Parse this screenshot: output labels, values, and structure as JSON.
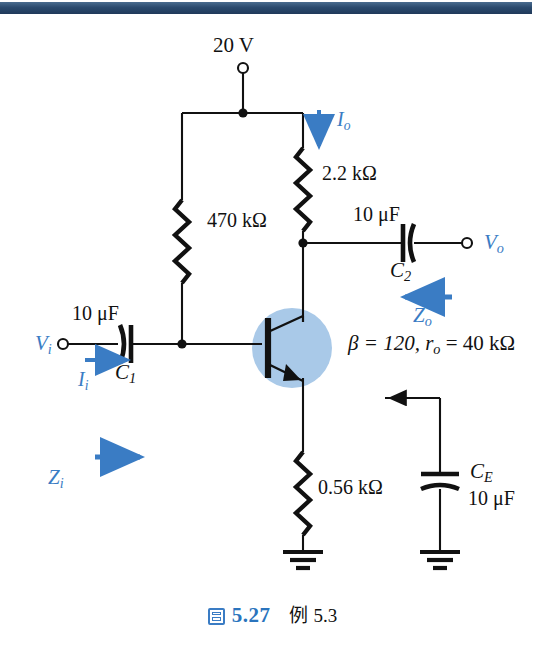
{
  "page": {
    "topbar_color": "#2e4f73",
    "background": "#ffffff",
    "accent_blue": "#3a7cc4"
  },
  "circuit": {
    "type": "bjt-common-emitter-amplifier-schematic",
    "supply": {
      "label": "20 V",
      "terminal": "open-circle"
    },
    "resistors": [
      {
        "name": "collector-resistor",
        "value": "2.2 kΩ"
      },
      {
        "name": "base-bias-resistor",
        "value": "470 kΩ"
      },
      {
        "name": "emitter-resistor",
        "value": "0.56 kΩ"
      }
    ],
    "capacitors": [
      {
        "name": "input-coupling-capacitor",
        "value": "10 μF",
        "designator_base": "C",
        "designator_sub": "1"
      },
      {
        "name": "output-coupling-capacitor",
        "value": "10 μF",
        "designator_base": "C",
        "designator_sub": "2"
      },
      {
        "name": "emitter-bypass-capacitor",
        "value": "10 μF",
        "designator_base": "C",
        "designator_sub": "E"
      }
    ],
    "transistor": {
      "kind": "npn",
      "parameters": "β = 120, rₒ = 40 kΩ",
      "beta_text": "β = 120,",
      "ro_base": "r",
      "ro_sub": "o",
      "ro_value": "= 40 kΩ"
    },
    "terminals": [
      {
        "name": "input-terminal",
        "base": "V",
        "sub": "i"
      },
      {
        "name": "output-terminal",
        "base": "V",
        "sub": "o"
      }
    ],
    "annotations": [
      {
        "name": "input-current-arrow",
        "base": "I",
        "sub": "i",
        "direction": "right"
      },
      {
        "name": "output-current-arrow",
        "base": "I",
        "sub": "o",
        "direction": "down"
      },
      {
        "name": "input-impedance-arrow",
        "base": "Z",
        "sub": "i",
        "direction": "right"
      },
      {
        "name": "output-impedance-arrow",
        "base": "Z",
        "sub": "o",
        "direction": "left"
      }
    ],
    "grounds": 2
  },
  "caption": {
    "figure_word_icon": "figure-icon",
    "number": "5.27",
    "example_word": "例",
    "example_number": "5.3"
  }
}
